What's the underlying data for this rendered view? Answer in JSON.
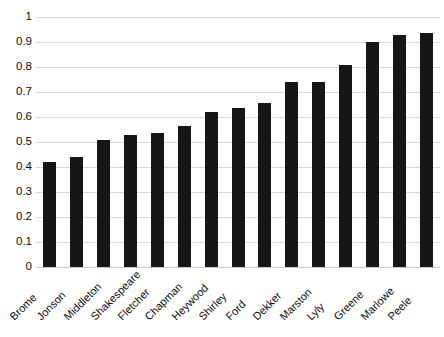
{
  "chart_data": {
    "type": "bar",
    "title": "",
    "subtitle": "",
    "xlabel": "",
    "ylabel": "",
    "ylim": [
      0,
      1
    ],
    "ytick_step": 0.1,
    "grid": true,
    "legend": false,
    "legend_position": "none",
    "bar_color": "#161616",
    "gridline_color": "#d9d9d9",
    "background_color": "#ffffff",
    "x_label_rotation": -45,
    "categories": [
      "Brome",
      "Jonson",
      "Middleton",
      "Shakespeare",
      "Fletcher",
      "Chapman",
      "Heywood",
      "Shirley",
      "Ford",
      "Dekker",
      "Marston",
      "Lyly",
      "Greene",
      "Marlowe",
      "Peele"
    ],
    "values": [
      0.42,
      0.44,
      0.51,
      0.53,
      0.535,
      0.565,
      0.62,
      0.635,
      0.655,
      0.74,
      0.74,
      0.81,
      0.9,
      0.93,
      0.935
    ],
    "ytick_labels": [
      "0",
      "0.1",
      "0.2",
      "0.3",
      "0.4",
      "0.5",
      "0.6",
      "0.7",
      "0.8",
      "0.9",
      "1"
    ],
    "ytick_values": [
      0,
      0.1,
      0.2,
      0.3,
      0.4,
      0.5,
      0.6,
      0.7,
      0.8,
      0.9,
      1
    ]
  }
}
